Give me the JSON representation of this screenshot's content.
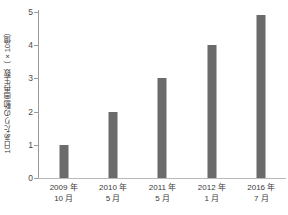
{
  "chart_data": {
    "type": "bar",
    "title": "",
    "xlabel": "",
    "ylabel": "1日あたりの動画再生数（×10億）",
    "categories": [
      "2009年\n10月",
      "2010年\n5月",
      "2011年\n5月",
      "2012年\n1月",
      "2016年\n7月"
    ],
    "category_lines": [
      {
        "line1": "2009 年",
        "line2": "10 月"
      },
      {
        "line1": "2010 年",
        "line2": "5 月"
      },
      {
        "line1": "2011 年",
        "line2": "5 月"
      },
      {
        "line1": "2012 年",
        "line2": "1 月"
      },
      {
        "line1": "2016 年",
        "line2": "7 月"
      }
    ],
    "values": [
      1,
      2,
      3,
      4,
      4.9
    ],
    "ylim": [
      0,
      5
    ],
    "yticks": [
      0,
      1,
      2,
      3,
      4,
      5
    ],
    "ytick_labels": [
      "0",
      "1",
      "2",
      "3",
      "4",
      "5"
    ],
    "grid": false,
    "legend": false,
    "bar_color": "#6b6b6b",
    "axis_color": "#9a9a9a",
    "background_color": "#ffffff",
    "text_color": "#3a3a3a"
  }
}
